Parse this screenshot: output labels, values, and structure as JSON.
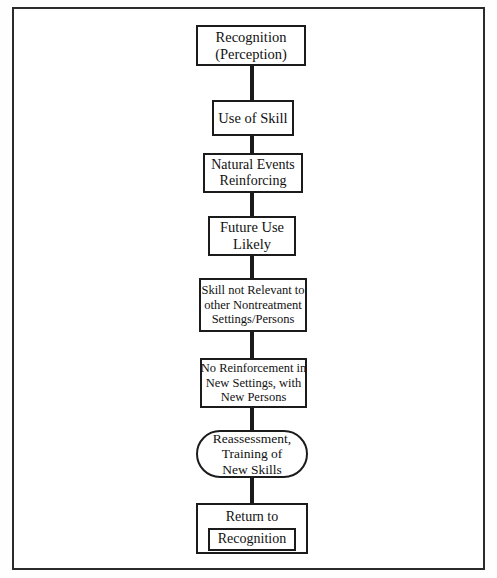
{
  "diagram": {
    "orientation": "vertical-top-down",
    "border_color": "#2b2b2b",
    "node_border_color": "#1b1b1b",
    "background_color": "#ffffff",
    "nodes": [
      {
        "id": "recognition",
        "shape": "rectangle",
        "lines": [
          "Recognition",
          "(Perception)"
        ]
      },
      {
        "id": "use-of-skill",
        "shape": "rectangle",
        "lines": [
          "Use of Skill"
        ]
      },
      {
        "id": "natural-events",
        "shape": "rectangle",
        "lines": [
          "Natural Events",
          "Reinforcing"
        ]
      },
      {
        "id": "future-use",
        "shape": "rectangle",
        "lines": [
          "Future Use",
          "Likely"
        ]
      },
      {
        "id": "skill-not-relevant",
        "shape": "rectangle",
        "lines": [
          "Skill not Relevant to",
          "other Nontreatment",
          "Settings/Persons"
        ]
      },
      {
        "id": "no-reinforcement",
        "shape": "rectangle",
        "lines": [
          "No Reinforcement in",
          "New Settings, with",
          "New Persons"
        ]
      },
      {
        "id": "reassessment",
        "shape": "rounded-rectangle",
        "lines": [
          "Reassessment,",
          "Training of",
          "New Skills"
        ]
      },
      {
        "id": "return",
        "shape": "rectangle-with-inner-box",
        "lines": [
          "Return to"
        ],
        "inner_label": "Recognition"
      }
    ],
    "connectors": [
      {
        "id": "conn-1",
        "from": "recognition",
        "to": "use-of-skill"
      },
      {
        "id": "conn-2",
        "from": "use-of-skill",
        "to": "natural-events"
      },
      {
        "id": "conn-3",
        "from": "natural-events",
        "to": "future-use"
      },
      {
        "id": "conn-4",
        "from": "future-use",
        "to": "skill-not-relevant"
      },
      {
        "id": "conn-5",
        "from": "skill-not-relevant",
        "to": "no-reinforcement"
      },
      {
        "id": "conn-6",
        "from": "no-reinforcement",
        "to": "reassessment"
      },
      {
        "id": "conn-7",
        "from": "reassessment",
        "to": "return"
      }
    ]
  }
}
